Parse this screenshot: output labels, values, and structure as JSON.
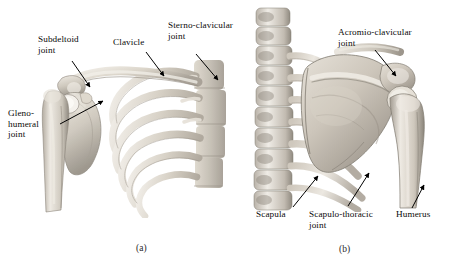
{
  "figure": {
    "background_color": "#ffffff",
    "text_color": "#0a0a0a",
    "bone_light": "#eae6de",
    "bone_mid": "#c8c2b8",
    "bone_dark": "#9a948a",
    "bone_shadow": "#6f6a62"
  },
  "panels": [
    {
      "id": "a",
      "caption": "(a)",
      "view": "anterior",
      "labels": [
        {
          "key": "subdeltoid",
          "text": "Subdeltoid\njoint"
        },
        {
          "key": "clavicle",
          "text": "Clavicle"
        },
        {
          "key": "sternoclavicular",
          "text": "Sterno-clavicular\njoint"
        },
        {
          "key": "glenohumeral",
          "text": "Gleno-\nhumeral\njoint"
        }
      ]
    },
    {
      "id": "b",
      "caption": "(b)",
      "view": "posterior",
      "labels": [
        {
          "key": "acromioclavicular",
          "text": "Acromio-clavicular\njoint"
        },
        {
          "key": "scapula",
          "text": "Scapula"
        },
        {
          "key": "scapulothoracic",
          "text": "Scapulo-thoracic\njoint"
        },
        {
          "key": "humerus",
          "text": "Humerus"
        }
      ]
    }
  ],
  "label_text": {
    "subdeltoid_line1": "Subdeltoid",
    "subdeltoid_line2": "joint",
    "clavicle": "Clavicle",
    "sternoclavicular_line1": "Sterno-clavicular",
    "sternoclavicular_line2": "joint",
    "glenohumeral_line1": "Gleno-",
    "glenohumeral_line2": "humeral",
    "glenohumeral_line3": "joint",
    "acromioclavicular_line1": "Acromio-clavicular",
    "acromioclavicular_line2": "joint",
    "scapula": "Scapula",
    "scapulothoracic_line1": "Scapulo-thoracic",
    "scapulothoracic_line2": "joint",
    "humerus": "Humerus",
    "caption_a": "(a)",
    "caption_b": "(b)"
  }
}
